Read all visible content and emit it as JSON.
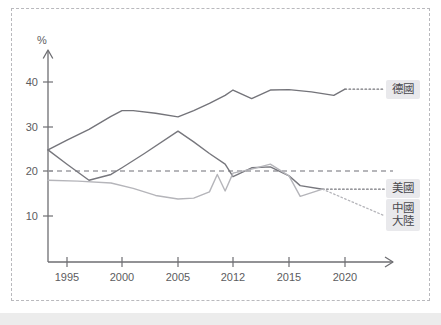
{
  "chart_data": {
    "type": "line",
    "title": "",
    "xlabel": "",
    "ylabel": "%",
    "ylim": [
      0,
      45
    ],
    "yticks": [
      10,
      20,
      30,
      40
    ],
    "ytick_labels": [
      "10",
      "20",
      "30",
      "40"
    ],
    "xtick_labels": [
      "1995",
      "2000",
      "2005",
      "2012",
      "2015",
      "2020"
    ],
    "x_positions": [
      1995,
      2000,
      2005,
      2012,
      2015,
      2020
    ],
    "grid": false,
    "legend_position": "right",
    "reference_line": {
      "value": 20,
      "style": "dashed",
      "color": "#9e9ea4"
    },
    "axis_arrows": {
      "x": "right-arrow",
      "y": "up-arrow"
    },
    "series": [
      {
        "name": "德國",
        "legend": "德國",
        "color": "#74747a",
        "x": [
          1993,
          1995,
          1997,
          1999,
          2000,
          2001,
          2003,
          2005,
          2007,
          2009,
          2011,
          2012,
          2013,
          2014,
          2015,
          2017,
          2019,
          2020
        ],
        "values": [
          24.8,
          27.0,
          29.4,
          32.3,
          33.6,
          33.6,
          33.0,
          32.2,
          33.6,
          35.2,
          37.0,
          38.2,
          36.3,
          38.2,
          38.3,
          37.8,
          37.0,
          38.4
        ],
        "projection_x": [
          2020,
          2024
        ],
        "projection_values": [
          38.4,
          38.4
        ],
        "projection_style": "dotted"
      },
      {
        "name": "美國",
        "legend": "美國",
        "color": "#77777d",
        "x": [
          1993,
          1995,
          1997,
          1999,
          2000,
          2002,
          2005,
          2007,
          2009,
          2011,
          2012,
          2013,
          2014,
          2015,
          2016,
          2018
        ],
        "values": [
          24.8,
          21.6,
          18.0,
          19.3,
          20.8,
          24.0,
          29.0,
          26.6,
          24.0,
          21.6,
          18.8,
          20.8,
          21.0,
          19.0,
          16.8,
          16.0
        ],
        "projection_x": [
          2018,
          2024
        ],
        "projection_values": [
          16.0,
          16.0
        ],
        "projection_style": "dotted"
      },
      {
        "name": "中國大陸",
        "legend": "中國\n大陸",
        "legend_line1": "中國",
        "legend_line2": "大陸",
        "color": "#b5b5ba",
        "x": [
          1993,
          1996,
          1999,
          2001,
          2003,
          2005,
          2007,
          2009,
          2010,
          2011,
          2012,
          2013,
          2014,
          2015,
          2016,
          2018
        ],
        "values": [
          18.0,
          17.8,
          17.4,
          16.2,
          14.6,
          13.8,
          14.0,
          15.4,
          19.3,
          15.6,
          19.6,
          20.5,
          21.6,
          19.0,
          14.4,
          16.0
        ],
        "projection_x": [
          2018,
          2024
        ],
        "projection_values": [
          16.0,
          10.0
        ],
        "projection_style": "dotted"
      }
    ]
  },
  "axis": {
    "y_unit": "%",
    "y_tick_40": "40",
    "y_tick_30": "30",
    "y_tick_20": "20",
    "y_tick_10": "10",
    "x_tick_1995": "1995",
    "x_tick_2000": "2000",
    "x_tick_2005": "2005",
    "x_tick_2012": "2012",
    "x_tick_2015": "2015",
    "x_tick_2020": "2020"
  },
  "legend": {
    "germany": "德國",
    "usa": "美國",
    "china_line1": "中國",
    "china_line2": "大陸"
  }
}
